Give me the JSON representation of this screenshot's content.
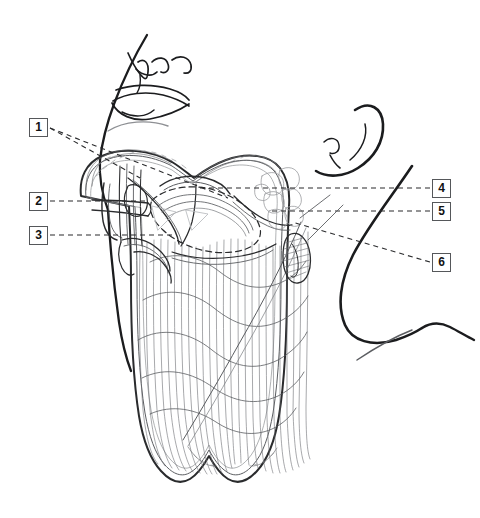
{
  "figure": {
    "type": "anatomical-line-drawing",
    "background_color": "#ffffff",
    "line_color": "#1b1c1e",
    "detail_line_color": "#5b5d61",
    "callout_border_color": "#55575a",
    "callout_text_color": "#111213",
    "leader_line_color": "#2a2b2d"
  },
  "callouts": [
    {
      "id": "1",
      "label": "1",
      "side": "left",
      "box_x": 29,
      "box_y": 118
    },
    {
      "id": "2",
      "label": "2",
      "side": "left",
      "box_x": 29,
      "box_y": 192
    },
    {
      "id": "3",
      "label": "3",
      "side": "left",
      "box_x": 29,
      "box_y": 226
    },
    {
      "id": "4",
      "label": "4",
      "side": "right",
      "box_x": 432,
      "box_y": 179
    },
    {
      "id": "5",
      "label": "5",
      "side": "right",
      "box_x": 432,
      "box_y": 202
    },
    {
      "id": "6",
      "label": "6",
      "side": "right",
      "box_x": 432,
      "box_y": 253
    }
  ]
}
